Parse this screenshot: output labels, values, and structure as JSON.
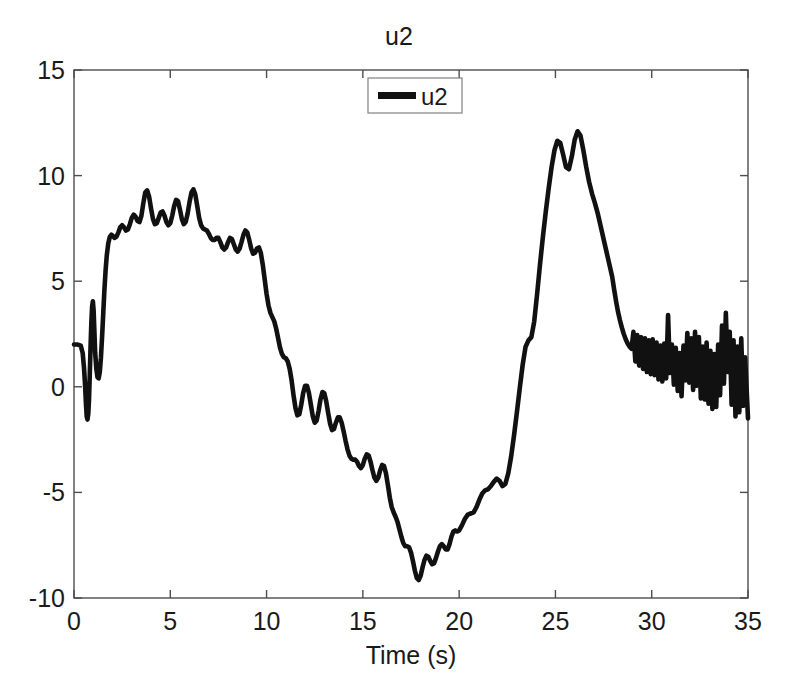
{
  "figure": {
    "title": "u2",
    "background_color": "#ffffff",
    "line_color": "#111111",
    "axis_color": "#4d4d4d"
  },
  "legend": {
    "position": "top-center",
    "entries": [
      {
        "label": "u2",
        "color": "#111111"
      }
    ]
  },
  "chart_data": {
    "type": "line",
    "title": "u2",
    "xlabel": "Time (s)",
    "ylabel": "",
    "xlim": [
      0,
      35
    ],
    "ylim": [
      -10,
      15
    ],
    "xticks": [
      0,
      5,
      10,
      15,
      20,
      25,
      30,
      35
    ],
    "yticks": [
      -10,
      -5,
      0,
      5,
      10,
      15
    ],
    "xticklabels": [
      "0",
      "5",
      "10",
      "15",
      "20",
      "25",
      "30",
      "35"
    ],
    "yticklabels": [
      "-10",
      "-5",
      "0",
      "5",
      "10",
      "15"
    ],
    "grid": false,
    "legend_entries": [
      "u2"
    ],
    "series": [
      {
        "name": "u2",
        "color": "#111111",
        "x": [
          0.0,
          0.2,
          0.35,
          0.45,
          0.52,
          0.58,
          0.62,
          0.66,
          0.7,
          0.74,
          0.78,
          0.82,
          0.86,
          0.9,
          0.94,
          0.98,
          1.02,
          1.06,
          1.1,
          1.16,
          1.22,
          1.28,
          1.34,
          1.4,
          1.46,
          1.52,
          1.58,
          1.64,
          1.7,
          1.78,
          1.86,
          1.94,
          2.02,
          2.1,
          2.2,
          2.3,
          2.4,
          2.5,
          2.6,
          2.7,
          2.8,
          2.9,
          3.0,
          3.1,
          3.2,
          3.3,
          3.4,
          3.5,
          3.6,
          3.7,
          3.8,
          3.9,
          4.0,
          4.1,
          4.2,
          4.3,
          4.4,
          4.5,
          4.6,
          4.7,
          4.8,
          4.9,
          5.0,
          5.1,
          5.2,
          5.3,
          5.4,
          5.5,
          5.6,
          5.7,
          5.8,
          5.9,
          6.0,
          6.1,
          6.2,
          6.3,
          6.4,
          6.5,
          6.6,
          6.7,
          6.8,
          6.9,
          7.0,
          7.1,
          7.2,
          7.3,
          7.4,
          7.5,
          7.6,
          7.7,
          7.8,
          7.9,
          8.0,
          8.1,
          8.2,
          8.3,
          8.4,
          8.5,
          8.6,
          8.7,
          8.8,
          8.9,
          9.0,
          9.1,
          9.2,
          9.3,
          9.4,
          9.5,
          9.6,
          9.7,
          9.8,
          9.9,
          10.0,
          10.1,
          10.2,
          10.3,
          10.4,
          10.5,
          10.6,
          10.7,
          10.8,
          10.9,
          11.0,
          11.1,
          11.2,
          11.3,
          11.4,
          11.5,
          11.6,
          11.7,
          11.8,
          11.9,
          12.0,
          12.1,
          12.2,
          12.3,
          12.4,
          12.5,
          12.6,
          12.7,
          12.8,
          12.9,
          13.0,
          13.1,
          13.2,
          13.3,
          13.4,
          13.5,
          13.6,
          13.7,
          13.8,
          13.9,
          14.0,
          14.1,
          14.2,
          14.3,
          14.4,
          14.5,
          14.6,
          14.7,
          14.8,
          14.9,
          15.0,
          15.1,
          15.2,
          15.3,
          15.4,
          15.5,
          15.6,
          15.7,
          15.8,
          15.9,
          16.0,
          16.1,
          16.2,
          16.3,
          16.4,
          16.5,
          16.6,
          16.7,
          16.8,
          16.9,
          17.0,
          17.1,
          17.2,
          17.3,
          17.4,
          17.5,
          17.6,
          17.7,
          17.8,
          17.9,
          18.0,
          18.1,
          18.2,
          18.3,
          18.4,
          18.5,
          18.6,
          18.7,
          18.8,
          18.9,
          19.0,
          19.1,
          19.2,
          19.3,
          19.4,
          19.5,
          19.6,
          19.7,
          19.8,
          19.9,
          20.0,
          20.15,
          20.3,
          20.45,
          20.6,
          20.75,
          20.9,
          21.05,
          21.2,
          21.35,
          21.5,
          21.65,
          21.8,
          21.95,
          22.1,
          22.25,
          22.4,
          22.55,
          22.7,
          22.85,
          23.0,
          23.15,
          23.3,
          23.45,
          23.6,
          23.75,
          23.9,
          24.05,
          24.2,
          24.35,
          24.5,
          24.65,
          24.8,
          24.95,
          25.1,
          25.25,
          25.4,
          25.55,
          25.7,
          25.85,
          26.0,
          26.15,
          26.3,
          26.45,
          26.6,
          26.75,
          26.9,
          27.05,
          27.2,
          27.35,
          27.5,
          27.65,
          27.8,
          27.95,
          28.05,
          28.15,
          28.25,
          28.35,
          28.45,
          28.55,
          28.65,
          28.75,
          28.85,
          28.95,
          29.05,
          29.15,
          29.25,
          29.35,
          29.45,
          29.55,
          29.65,
          29.75,
          29.85,
          29.95,
          30.05,
          30.15,
          30.25,
          30.35,
          30.45,
          30.55,
          30.65,
          30.75,
          30.85,
          30.95,
          31.05,
          31.15,
          31.25,
          31.35,
          31.45,
          31.55,
          31.65,
          31.75,
          31.85,
          31.95,
          32.05,
          32.15,
          32.25,
          32.35,
          32.45,
          32.55,
          32.65,
          32.75,
          32.85,
          32.95,
          33.05,
          33.15,
          33.25,
          33.35,
          33.45,
          33.55,
          33.65,
          33.75,
          33.85,
          33.95,
          34.05,
          34.15,
          34.25,
          34.35,
          34.45,
          34.55,
          34.65,
          34.75,
          34.85,
          35.0
        ],
        "y": [
          2.0,
          2.0,
          1.95,
          1.6,
          0.9,
          0.0,
          -0.8,
          -1.4,
          -1.55,
          -1.3,
          -0.6,
          0.6,
          1.9,
          3.0,
          3.8,
          4.05,
          3.6,
          2.6,
          1.6,
          0.85,
          0.45,
          0.4,
          0.7,
          1.4,
          2.4,
          3.5,
          4.6,
          5.5,
          6.2,
          6.8,
          7.1,
          7.2,
          7.15,
          7.05,
          7.1,
          7.3,
          7.55,
          7.65,
          7.55,
          7.4,
          7.45,
          7.7,
          8.0,
          8.15,
          8.05,
          7.85,
          7.8,
          8.1,
          8.7,
          9.2,
          9.3,
          9.0,
          8.45,
          7.95,
          7.7,
          7.75,
          8.0,
          8.25,
          8.3,
          8.1,
          7.8,
          7.65,
          7.75,
          8.1,
          8.55,
          8.85,
          8.8,
          8.4,
          7.95,
          7.7,
          7.8,
          8.2,
          8.75,
          9.2,
          9.35,
          9.1,
          8.55,
          8.0,
          7.65,
          7.5,
          7.45,
          7.4,
          7.25,
          7.05,
          6.95,
          6.95,
          7.05,
          7.05,
          6.85,
          6.6,
          6.5,
          6.6,
          6.85,
          7.05,
          7.0,
          6.75,
          6.5,
          6.4,
          6.55,
          6.85,
          7.2,
          7.4,
          7.3,
          6.95,
          6.55,
          6.3,
          6.35,
          6.55,
          6.6,
          6.35,
          5.8,
          5.1,
          4.4,
          3.85,
          3.5,
          3.3,
          3.1,
          2.75,
          2.3,
          1.85,
          1.55,
          1.4,
          1.35,
          1.2,
          0.85,
          0.3,
          -0.4,
          -1.0,
          -1.35,
          -1.3,
          -0.85,
          -0.3,
          0.05,
          0.05,
          -0.3,
          -0.85,
          -1.4,
          -1.7,
          -1.6,
          -1.15,
          -0.6,
          -0.25,
          -0.3,
          -0.7,
          -1.25,
          -1.75,
          -2.05,
          -2.0,
          -1.7,
          -1.45,
          -1.45,
          -1.7,
          -2.1,
          -2.55,
          -2.95,
          -3.25,
          -3.4,
          -3.45,
          -3.45,
          -3.55,
          -3.75,
          -3.85,
          -3.7,
          -3.4,
          -3.2,
          -3.25,
          -3.55,
          -3.95,
          -4.3,
          -4.45,
          -4.3,
          -3.95,
          -3.7,
          -3.75,
          -4.1,
          -4.65,
          -5.25,
          -5.7,
          -5.95,
          -6.15,
          -6.4,
          -6.75,
          -7.1,
          -7.4,
          -7.55,
          -7.55,
          -7.6,
          -7.85,
          -8.25,
          -8.7,
          -9.05,
          -9.15,
          -8.95,
          -8.55,
          -8.2,
          -8.0,
          -8.05,
          -8.25,
          -8.4,
          -8.35,
          -8.1,
          -7.8,
          -7.55,
          -7.45,
          -7.55,
          -7.7,
          -7.7,
          -7.45,
          -7.1,
          -6.85,
          -6.8,
          -6.85,
          -6.8,
          -6.55,
          -6.25,
          -6.05,
          -6.0,
          -5.95,
          -5.7,
          -5.35,
          -5.05,
          -4.9,
          -4.85,
          -4.7,
          -4.5,
          -4.35,
          -4.45,
          -4.7,
          -4.6,
          -4.1,
          -3.3,
          -2.3,
          -1.2,
          -0.05,
          1.05,
          1.9,
          2.2,
          2.35,
          3.1,
          4.4,
          5.8,
          7.1,
          8.3,
          9.4,
          10.4,
          11.2,
          11.65,
          11.55,
          11.0,
          10.4,
          10.3,
          10.9,
          11.7,
          12.1,
          11.9,
          11.2,
          10.4,
          9.7,
          9.15,
          8.7,
          8.2,
          7.6,
          7.0,
          6.4,
          5.8,
          5.2,
          4.6,
          4.05,
          3.55,
          3.15,
          2.8,
          2.5,
          2.25,
          2.05,
          1.9,
          1.8,
          2.6,
          1.2,
          2.45,
          1.0,
          2.35,
          0.85,
          2.3,
          0.7,
          2.2,
          0.6,
          2.25,
          0.55,
          2.1,
          0.35,
          1.95,
          0.25,
          2.05,
          0.4,
          3.4,
          0.65,
          2.0,
          0.1,
          1.85,
          -0.2,
          1.6,
          -0.45,
          1.95,
          0.3,
          2.55,
          0.2,
          2.3,
          -0.15,
          2.6,
          0.05,
          2.35,
          -0.55,
          1.9,
          -0.6,
          2.1,
          -0.8,
          1.7,
          -1.05,
          1.55,
          -0.95,
          2.0,
          -0.4,
          2.9,
          0.15,
          3.5,
          0.7,
          2.6,
          -0.85,
          2.2,
          -1.4,
          1.9,
          -1.2,
          2.3,
          -0.9,
          1.4,
          -1.5
        ]
      }
    ],
    "annotations": {
      "description": "Thick black noisy control-signal trace u2 versus time; starts near 2, initial transient dipping to about -1.5 near t=0.7 and spiking to about 4 near t=1, rises to a plateau around 7-9.3 between t=2 and t=7, decreases through oscillations to a minimum near -9.1 at t=17, recovers through a shoulder near -4.8 around t=20.5, rises to a double peak of about 11.7 at t=23.9 and 12.1 at t=24.8, then decays to a rapidly oscillating band between roughly -1.5 and 3.5 from t=28 to t=35.",
      "min_value": -9.15,
      "min_time": 17.0,
      "max_value": 12.1,
      "max_time": 24.8,
      "start_value": 2.0
    }
  },
  "axes_pixels": {
    "left": 74,
    "right": 748,
    "top": 70,
    "bottom": 598
  }
}
